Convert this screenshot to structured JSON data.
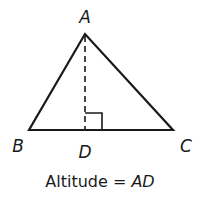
{
  "diagram": {
    "type": "triangle-altitude",
    "vertices": {
      "A": {
        "label": "A",
        "x": 85,
        "y": 34
      },
      "B": {
        "label": "B",
        "x": 29,
        "y": 130
      },
      "C": {
        "label": "C",
        "x": 173,
        "y": 130
      },
      "D": {
        "label": "D",
        "x": 85,
        "y": 130
      }
    },
    "labels": {
      "A": "A",
      "B": "B",
      "C": "C",
      "D": "D"
    },
    "caption": {
      "prefix": "Altitude = ",
      "value": "AD"
    },
    "right_angle_marker": {
      "at": "D",
      "size": 17
    },
    "colors": {
      "stroke": "#1a1a1a",
      "background": "#ffffff"
    }
  }
}
